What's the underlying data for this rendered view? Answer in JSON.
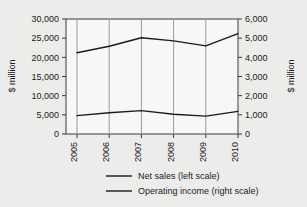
{
  "chart_data": {
    "type": "line",
    "title": "",
    "xlabel": "",
    "ylabel": "$ million",
    "y2label": "$ million",
    "categories": [
      "2005",
      "2006",
      "2007",
      "2008",
      "2009",
      "2010"
    ],
    "ylim": [
      0,
      30000
    ],
    "y2lim": [
      0,
      6000
    ],
    "yticks": [
      "0",
      "5,000",
      "10,000",
      "15,000",
      "20,000",
      "25,000",
      "30,000"
    ],
    "ytick_values": [
      0,
      5000,
      10000,
      15000,
      20000,
      25000,
      30000
    ],
    "y2ticks": [
      "0",
      "1,000",
      "2,000",
      "3,000",
      "4,000",
      "5,000",
      "6,000"
    ],
    "y2tick_values": [
      0,
      1000,
      2000,
      3000,
      4000,
      5000,
      6000
    ],
    "grid": "vertical-only",
    "legend_position": "bottom",
    "series": [
      {
        "name": "Net sales (left scale)",
        "axis": "left",
        "color": "#1b1b1b",
        "values": [
          21200,
          22900,
          25100,
          24300,
          23000,
          26200
        ]
      },
      {
        "name": "Operating income (right scale)",
        "axis": "right",
        "color": "#1b1b1b",
        "values": [
          960,
          1110,
          1220,
          1030,
          930,
          1180
        ]
      }
    ]
  },
  "legend": {
    "items": [
      {
        "label": "Net sales (left scale)"
      },
      {
        "label": "Operating income (right scale)"
      }
    ]
  },
  "axes": {
    "left_title": "$ million",
    "right_title": "$ million"
  }
}
